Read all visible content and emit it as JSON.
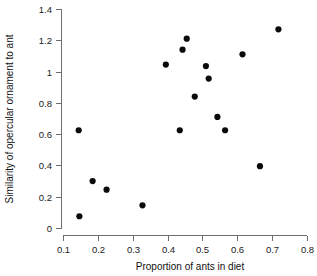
{
  "chart_data": {
    "type": "scatter",
    "title": "",
    "xlabel": "Proportion of ants in diet",
    "ylabel": "Similarity of opercular ornament to ant",
    "xlim": [
      0.1,
      0.8
    ],
    "ylim": [
      0,
      1.4
    ],
    "xticks": [
      "0.1",
      "0.2",
      "0.3",
      "0.4",
      "0.5",
      "0.6",
      "0.7",
      "0.8"
    ],
    "xtick_values": [
      0.1,
      0.2,
      0.3,
      0.4,
      0.5,
      0.6,
      0.7,
      0.8
    ],
    "yticks": [
      "0",
      "0.2",
      "0.4",
      "0.6",
      "0.8",
      "1",
      "1.2",
      "1.4"
    ],
    "ytick_values": [
      0,
      0.2,
      0.4,
      0.6,
      0.8,
      1.0,
      1.2,
      1.4
    ],
    "grid": false,
    "legend": false,
    "marker": "filled-circle",
    "marker_color": "#0a0a0a",
    "points": [
      {
        "x": 0.145,
        "y": 0.625
      },
      {
        "x": 0.147,
        "y": 0.075
      },
      {
        "x": 0.185,
        "y": 0.3
      },
      {
        "x": 0.225,
        "y": 0.245
      },
      {
        "x": 0.328,
        "y": 0.145
      },
      {
        "x": 0.395,
        "y": 1.045
      },
      {
        "x": 0.435,
        "y": 0.625
      },
      {
        "x": 0.443,
        "y": 1.14
      },
      {
        "x": 0.455,
        "y": 1.21
      },
      {
        "x": 0.478,
        "y": 0.84
      },
      {
        "x": 0.51,
        "y": 1.035
      },
      {
        "x": 0.518,
        "y": 0.955
      },
      {
        "x": 0.543,
        "y": 0.71
      },
      {
        "x": 0.565,
        "y": 0.625
      },
      {
        "x": 0.615,
        "y": 1.11
      },
      {
        "x": 0.665,
        "y": 0.395
      },
      {
        "x": 0.718,
        "y": 1.27
      }
    ]
  },
  "axes": {
    "x_label": "Proportion of ants in diet",
    "y_label": "Similarity of opercular ornament to ant"
  },
  "colors": {
    "marker": "#0a0a0a",
    "axis": "#6e6e6e",
    "text": "#1a1a1a",
    "background": "#ffffff"
  }
}
